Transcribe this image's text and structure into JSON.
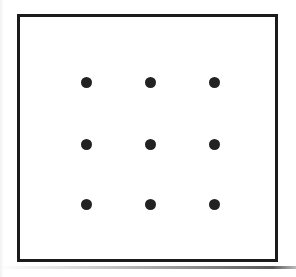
{
  "figure": {
    "canvas": {
      "width": 296,
      "height": 277,
      "background_color": "#ffffff"
    },
    "frame": {
      "name": "outer-rectangle",
      "stroke_color": "#1b1b1b",
      "stroke_width_px": 3,
      "fill_color": "#ffffff",
      "left": 17,
      "top": 14,
      "width": 261,
      "height": 248
    },
    "dot_style": {
      "color": "#222222",
      "diameter_px": 11,
      "shape": "circle"
    },
    "grid": {
      "rows": 3,
      "columns": 3,
      "total_dots": 9,
      "column_centers_px": [
        83,
        147,
        211
      ],
      "row_centers_px": [
        79,
        141,
        201
      ]
    },
    "dots": [
      {
        "id": "dot-r1c1",
        "row": 1,
        "column": 1,
        "cx": 66,
        "cy": 65
      },
      {
        "id": "dot-r1c2",
        "row": 1,
        "column": 2,
        "cx": 130,
        "cy": 65
      },
      {
        "id": "dot-r1c3",
        "row": 1,
        "column": 3,
        "cx": 194,
        "cy": 65
      },
      {
        "id": "dot-r2c1",
        "row": 2,
        "column": 1,
        "cx": 66,
        "cy": 127
      },
      {
        "id": "dot-r2c2",
        "row": 2,
        "column": 2,
        "cx": 130,
        "cy": 127
      },
      {
        "id": "dot-r2c3",
        "row": 2,
        "column": 3,
        "cx": 194,
        "cy": 127
      },
      {
        "id": "dot-r3c1",
        "row": 3,
        "column": 1,
        "cx": 66,
        "cy": 187
      },
      {
        "id": "dot-r3c2",
        "row": 3,
        "column": 2,
        "cx": 130,
        "cy": 187
      },
      {
        "id": "dot-r3c3",
        "row": 3,
        "column": 3,
        "cx": 194,
        "cy": 187
      }
    ],
    "artifacts": {
      "bottom_scan_shadow": true,
      "left_scan_edge": true
    }
  }
}
